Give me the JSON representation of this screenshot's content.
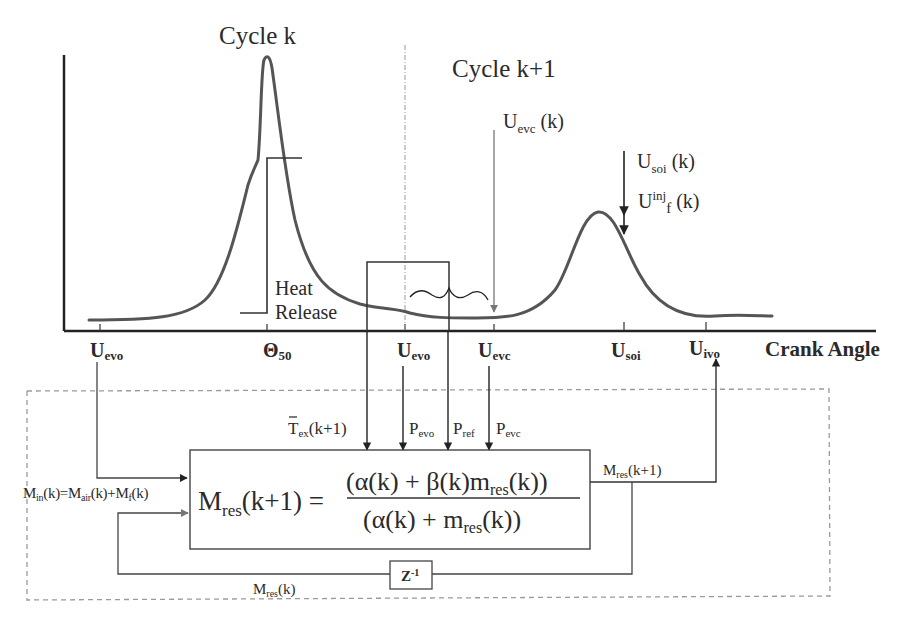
{
  "titles": {
    "cycle_k": "Cycle k",
    "cycle_k1": "Cycle k+1"
  },
  "annotations": {
    "heat_release_line1": "Heat",
    "heat_release_line2": "Release",
    "uevc_k_main": "U",
    "uevc_k_sub": "evc",
    "uevc_k_arg": " (k)",
    "usoi_k_main": "U",
    "usoi_k_sub": "soi",
    "usoi_k_arg": " (k)",
    "uinj_main": "U",
    "uinj_sup": "inj",
    "uinj_sub": "f",
    "uinj_arg": " (k)"
  },
  "axis": {
    "x_label": "Crank Angle",
    "ticks": [
      {
        "main": "U",
        "sub": "evo"
      },
      {
        "main": "Θ",
        "sub": "50"
      },
      {
        "main": "U",
        "sub": "evo"
      },
      {
        "main": "U",
        "sub": "evc"
      },
      {
        "main": "U",
        "sub": "soi"
      },
      {
        "main": "U",
        "sub": "ivo"
      }
    ]
  },
  "block": {
    "inputs": {
      "tex_main": "T",
      "tex_sub": "ex",
      "tex_arg": "(k+1)",
      "pevo_main": "P",
      "pevo_sub": "evo",
      "pref_main": "P",
      "pref_sub": "ref",
      "pevc_main": "P",
      "pevc_sub": "evc"
    },
    "min_label": {
      "m1": "M",
      "s1": "in",
      "a1": "(k)=M",
      "s2": "air",
      "a2": "(k)+M",
      "s3": "f",
      "a3": "(k)"
    },
    "formula": {
      "lhs_main": "M",
      "lhs_sub": "res",
      "lhs_arg": "(k+1) =",
      "num_a": "(α(k) + β(k)m",
      "num_sub": "res",
      "num_b": "(k))",
      "den_a": "(α(k) + m",
      "den_sub": "res",
      "den_b": "(k))"
    },
    "output": {
      "main": "M",
      "sub": "res",
      "arg": "(k+1)"
    },
    "feedback": {
      "main": "M",
      "sub": "res",
      "arg": "(k)"
    },
    "delay": {
      "main": "Z",
      "sup": "-1"
    }
  },
  "colors": {
    "curve": "#555555",
    "line": "#333333",
    "dashed": "#9a9a9a",
    "text": "#2a2a2a"
  }
}
